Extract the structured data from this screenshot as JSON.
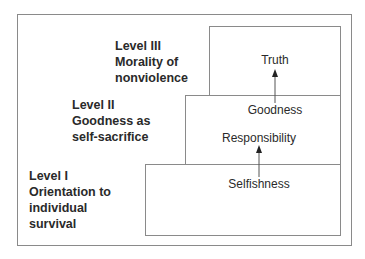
{
  "diagram": {
    "title": "",
    "levels": [
      {
        "id": "level-1",
        "heading": "Level I",
        "lines": [
          "Orientation to",
          "individual",
          "survival"
        ]
      },
      {
        "id": "level-2",
        "heading": "Level II",
        "lines": [
          "Goodness as",
          "self-sacrifice"
        ]
      },
      {
        "id": "level-3",
        "heading": "Level III",
        "lines": [
          "Morality of",
          "nonviolence"
        ]
      }
    ],
    "values": {
      "selfishness": "Selfishness",
      "responsibility": "Responsibility",
      "goodness": "Goodness",
      "truth": "Truth"
    },
    "arrows": [
      {
        "from": "Selfishness",
        "to": "Responsibility"
      },
      {
        "from": "Goodness",
        "to": "Truth"
      }
    ],
    "colors": {
      "line": "#8a8a8a",
      "text": "#2a2a2a",
      "arrow": "#333333"
    }
  }
}
